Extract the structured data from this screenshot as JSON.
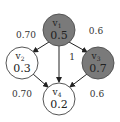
{
  "diagram": {
    "type": "directed-graph",
    "nodes": [
      {
        "id": "v1",
        "label": "v",
        "sub": "1",
        "value": "0.5",
        "fill": "#7a7a7a",
        "cx": 59,
        "cy": 30
      },
      {
        "id": "v2",
        "label": "v",
        "sub": "2",
        "value": "0.3",
        "fill": "#ffffff",
        "cx": 22,
        "cy": 63
      },
      {
        "id": "v3",
        "label": "v",
        "sub": "3",
        "value": "0.7",
        "fill": "#7a7a7a",
        "cx": 98,
        "cy": 63
      },
      {
        "id": "v4",
        "label": "v",
        "sub": "4",
        "value": "0.2",
        "fill": "#ffffff",
        "cx": 59,
        "cy": 99
      }
    ],
    "edges": [
      {
        "from": "v1",
        "to": "v2",
        "weight": "0.70"
      },
      {
        "from": "v1",
        "to": "v3",
        "weight": "0.6"
      },
      {
        "from": "v1",
        "to": "v4",
        "weight": "1"
      },
      {
        "from": "v2",
        "to": "v4",
        "weight": "0.70"
      },
      {
        "from": "v3",
        "to": "v4",
        "weight": "0.6"
      }
    ]
  }
}
